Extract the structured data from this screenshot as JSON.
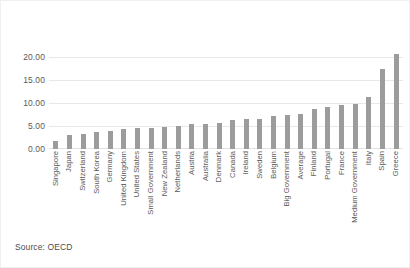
{
  "chart_data": {
    "type": "bar",
    "title": "",
    "subtitle": "",
    "xlabel": "",
    "ylabel": "",
    "ylim": [
      0,
      20
    ],
    "yticks": [
      "0.00",
      "5.00",
      "10.00",
      "15.00",
      "20.00"
    ],
    "ytick_values": [
      0,
      5,
      10,
      15,
      20
    ],
    "grid": true,
    "legend": null,
    "bar_color": "#9c9c9c",
    "categories": [
      "Singapore",
      "Japan",
      "Switzerland",
      "South Korea",
      "Germany",
      "United Kingdom",
      "United States",
      "Small Government",
      "New Zealand",
      "Netherlands",
      "Austria",
      "Australia",
      "Denmark",
      "Canada",
      "Ireland",
      "Sweden",
      "Belgium",
      "Big Government",
      "Average",
      "Finland",
      "Portugal",
      "France",
      "Medium Government",
      "Italy",
      "Spain",
      "Greece"
    ],
    "values": [
      1.8,
      3.0,
      3.2,
      3.8,
      3.9,
      4.4,
      4.5,
      4.6,
      4.7,
      5.1,
      5.4,
      5.5,
      5.7,
      6.2,
      6.5,
      6.6,
      7.1,
      7.3,
      7.6,
      8.8,
      9.1,
      9.5,
      9.8,
      11.4,
      17.3,
      20.6
    ]
  },
  "source": {
    "label": "Source: OECD"
  }
}
